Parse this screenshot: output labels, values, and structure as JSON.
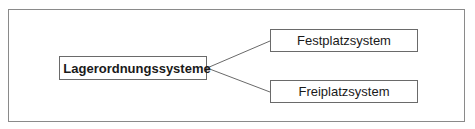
{
  "diagram": {
    "root": {
      "label": "Lagerordnungssysteme"
    },
    "children": [
      {
        "label": "Festplatzsystem"
      },
      {
        "label": "Freiplatzsystem"
      }
    ],
    "colors": {
      "border": "#6a6a6a",
      "frame": "#8a8a8a",
      "text": "#1a1a1a"
    }
  }
}
